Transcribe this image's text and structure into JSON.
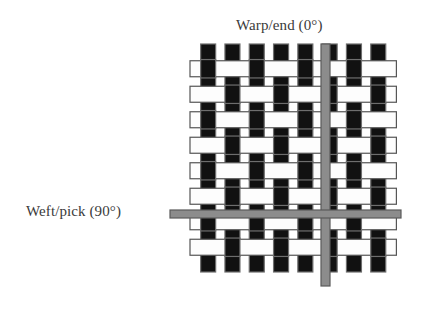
{
  "figure": {
    "background_color": "#ffffff"
  },
  "labels": {
    "warp": "Warp/end (0°)",
    "weft": "Weft/pick (90°)",
    "text_color": "#3a3a3a"
  },
  "colors": {
    "warp_fill": "#111111",
    "warp_stroke": "#6e6e6e",
    "weft_fill": "#fdfdfd",
    "weft_stroke": "#555555",
    "highlight_fill": "#8c8c8c",
    "highlight_stroke": "#5a5a5a",
    "background": "#ffffff"
  },
  "diagram_data": {
    "type": "weave",
    "weave_pattern": "plain weave 1/1",
    "warp_count": 8,
    "weft_count": 8,
    "warp_angle_degrees": 0,
    "weft_angle_degrees": 90,
    "grid": {
      "left": 196,
      "top": 56,
      "cell_width": 24.3,
      "cell_height": 25.5,
      "warp_bar_width": 15,
      "weft_bar_height": 16,
      "warp_overhang": 12,
      "weft_overhang": 6
    },
    "highlighted_warp_index": 5,
    "highlighted_weft_index": 6,
    "highlight_warp": {
      "x": 321,
      "y_top": 44,
      "y_bottom": 286,
      "width": 9
    },
    "highlight_weft": {
      "y": 210,
      "x_left": 170,
      "x_right": 401,
      "height": 8
    },
    "interlacing_rule": "warp is over weft when (warp_index + weft_index) is even"
  }
}
